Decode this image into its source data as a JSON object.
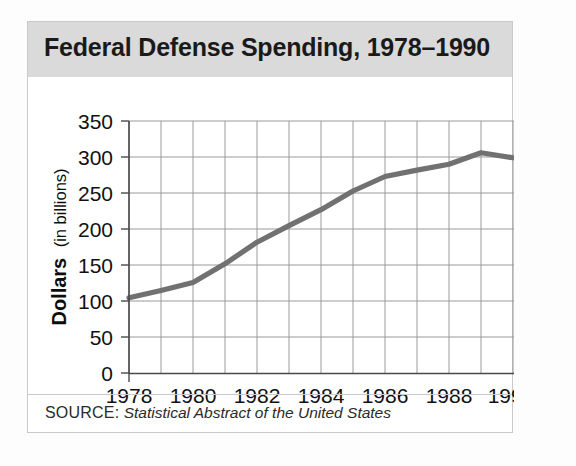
{
  "figure": {
    "title": "Federal Defense Spending, 1978–1990",
    "source_prefix": "SOURCE:",
    "source_text": "Statistical Abstract of the United States",
    "frame_color": "#c9c9c9",
    "title_bar_color": "#dadada",
    "line_color": "#717171",
    "grid_color": "#9a9a9a"
  },
  "axis": {
    "y_label_bold": "Dollars",
    "y_label_light": "(in billions)",
    "y_ticks": [
      "0",
      "50",
      "100",
      "150",
      "200",
      "250",
      "300",
      "350"
    ],
    "x_ticks": [
      "1978",
      "1980",
      "1982",
      "1984",
      "1986",
      "1988",
      "1990"
    ]
  },
  "chart_data": {
    "type": "line",
    "title": "Federal Defense Spending, 1978–1990",
    "xlabel": "",
    "ylabel": "Dollars (in billions)",
    "xlim": [
      1978,
      1990
    ],
    "ylim": [
      0,
      350
    ],
    "y_ticks": [
      0,
      50,
      100,
      150,
      200,
      250,
      300,
      350
    ],
    "x_ticks": [
      1978,
      1980,
      1982,
      1984,
      1986,
      1988,
      1990
    ],
    "x_minor_ticks": [
      1979,
      1981,
      1983,
      1985,
      1987,
      1989
    ],
    "grid": true,
    "legend": null,
    "units": "billions of dollars",
    "source": "Statistical Abstract of the United States",
    "x": [
      1978,
      1979,
      1980,
      1981,
      1982,
      1983,
      1984,
      1985,
      1986,
      1987,
      1988,
      1989,
      1990
    ],
    "values": [
      105,
      115,
      126,
      152,
      182,
      205,
      227,
      253,
      273,
      282,
      290,
      306,
      299
    ],
    "series": [
      {
        "name": "Federal defense spending",
        "values": [
          105,
          115,
          126,
          152,
          182,
          205,
          227,
          253,
          273,
          282,
          290,
          306,
          299
        ]
      }
    ]
  }
}
